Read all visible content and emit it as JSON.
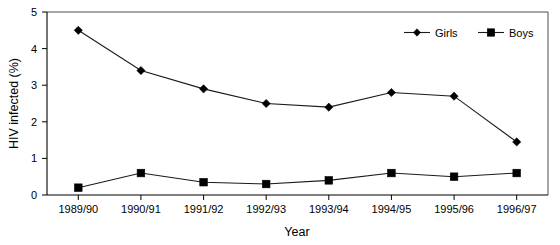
{
  "chart_data": {
    "type": "line",
    "title": "",
    "xlabel": "Year",
    "ylabel": "HIV infected (%)",
    "categories": [
      "1989/90",
      "1990/91",
      "1991/92",
      "1992/93",
      "1993/94",
      "1994/95",
      "1995/96",
      "1996/97"
    ],
    "series": [
      {
        "name": "Girls",
        "marker": "diamond",
        "color": "#000000",
        "values": [
          4.5,
          3.4,
          2.9,
          2.5,
          2.4,
          2.8,
          2.7,
          1.45
        ]
      },
      {
        "name": "Boys",
        "marker": "square",
        "color": "#000000",
        "values": [
          0.2,
          0.6,
          0.35,
          0.3,
          0.4,
          0.6,
          0.5,
          0.6
        ]
      }
    ],
    "ylim": [
      0,
      5
    ],
    "yticks": [
      0,
      1,
      2,
      3,
      4,
      5
    ],
    "ytick_labels": [
      "0",
      "1",
      "2",
      "3",
      "4",
      "5"
    ],
    "grid": false,
    "legend_position": "top-right-inside",
    "legend_entries": [
      "Girls",
      "Boys"
    ],
    "background_color": "#ffffff",
    "frame_color": "#4d4d4d"
  },
  "axes": {
    "y_title": "HIV infected (%)",
    "x_title": "Year"
  },
  "legend": {
    "girls_label": "Girls",
    "boys_label": "Boys"
  },
  "yticks": {
    "t0": "0",
    "t1": "1",
    "t2": "2",
    "t3": "3",
    "t4": "4",
    "t5": "5"
  },
  "xticks": {
    "t0": "1989/90",
    "t1": "1990/91",
    "t2": "1991/92",
    "t3": "1992/93",
    "t4": "1993/94",
    "t5": "1994/95",
    "t6": "1995/96",
    "t7": "1996/97"
  }
}
